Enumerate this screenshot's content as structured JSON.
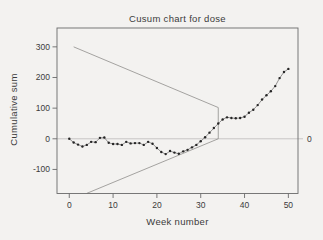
{
  "figure": {
    "title": "Cusum chart for dose",
    "xlabel": "Week number",
    "ylabel": "Cumulative sum"
  },
  "chart_data": {
    "type": "line",
    "title": "Cusum chart for dose",
    "xlabel": "Week number",
    "ylabel": "Cumulative sum",
    "x": [
      0,
      1,
      2,
      3,
      4,
      5,
      6,
      7,
      8,
      9,
      10,
      11,
      12,
      13,
      14,
      15,
      16,
      17,
      18,
      19,
      20,
      21,
      22,
      23,
      24,
      25,
      26,
      27,
      28,
      29,
      30,
      31,
      32,
      33,
      34,
      35,
      36,
      37,
      38,
      39,
      40,
      41,
      42,
      43,
      44,
      45,
      46,
      47,
      48,
      49,
      50
    ],
    "series": [
      {
        "name": "cumulative-sum-of-dose",
        "marker": "dot",
        "values": [
          0,
          -12,
          -19,
          -25,
          -20,
          -10,
          -11,
          3,
          4,
          -13,
          -17,
          -17,
          -20,
          -10,
          -15,
          -14,
          -14,
          -20,
          -10,
          -16,
          -30,
          -43,
          -50,
          -40,
          -45,
          -49,
          -41,
          -36,
          -28,
          -20,
          -8,
          5,
          20,
          35,
          50,
          63,
          70,
          68,
          67,
          68,
          72,
          85,
          95,
          110,
          128,
          142,
          155,
          172,
          198,
          218,
          228
        ]
      }
    ],
    "vmask": {
      "upper_arm": [
        [
          1,
          300
        ],
        [
          34,
          102
        ]
      ],
      "vertical": [
        [
          34,
          102
        ],
        [
          34,
          0
        ]
      ],
      "lower_arm": [
        [
          4,
          -178
        ],
        [
          34,
          0
        ]
      ]
    },
    "xticks": [
      0,
      10,
      20,
      30,
      40,
      50
    ],
    "yticks": [
      300,
      200,
      100,
      0,
      -100
    ],
    "right_yticks": [
      0
    ],
    "xlim": [
      -2.8,
      52.2
    ],
    "ylim": [
      -178.5,
      361.5
    ],
    "zero_line": true,
    "grid": false,
    "legend": false
  },
  "colors": {
    "background": "#f3f2f0",
    "axis": "#6a6a6a",
    "text": "#3b3b3b",
    "marker": "#262626",
    "series_line": "#7a7978",
    "mask_line": "#8f8e8c",
    "zero_line": "#c2c1bf"
  }
}
